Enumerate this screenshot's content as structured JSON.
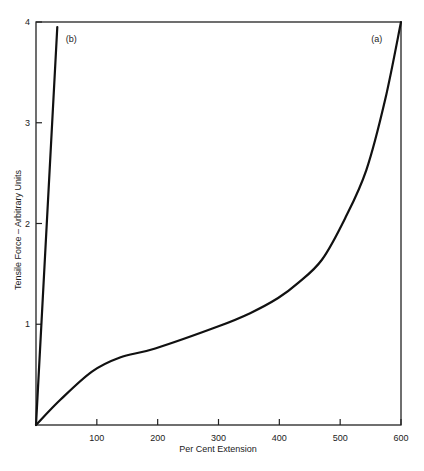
{
  "chart_data": {
    "type": "line",
    "title": "",
    "xlabel": "Per Cent Extension",
    "ylabel": "Tensile Force – Arbitrary Units",
    "xlim": [
      0,
      600
    ],
    "ylim": [
      0,
      4
    ],
    "xticks": [
      100,
      200,
      300,
      400,
      500,
      600
    ],
    "yticks": [
      1,
      2,
      3,
      4
    ],
    "grid": false,
    "legend": "none (inline series labels)",
    "series": [
      {
        "name": "(a)",
        "x": [
          0,
          40,
          92,
          138,
          196,
          300,
          352,
          398,
          431,
          470,
          508,
          543,
          574,
          600
        ],
        "y": [
          0,
          0.25,
          0.53,
          0.67,
          0.76,
          0.98,
          1.11,
          1.26,
          1.41,
          1.64,
          2.05,
          2.53,
          3.23,
          4.0
        ]
      },
      {
        "name": "(b)",
        "x": [
          0,
          35
        ],
        "y": [
          0,
          3.95
        ]
      }
    ],
    "annotations": [
      {
        "text": "(a)",
        "x": 560,
        "y": 3.8
      },
      {
        "text": "(b)",
        "x": 58,
        "y": 3.8
      }
    ]
  },
  "plot": {
    "left": 36,
    "right": 401,
    "top": 22,
    "bottom": 425
  }
}
